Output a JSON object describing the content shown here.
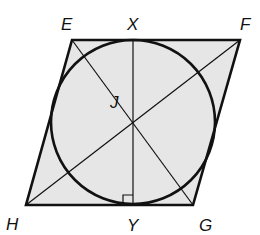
{
  "diagram": {
    "type": "rhombus-with-inscribed-circle",
    "colors": {
      "fill": "#e6e6e6",
      "stroke": "#111111",
      "background": "#ffffff"
    },
    "points": {
      "E": {
        "label": "E",
        "x": 72,
        "y": 40,
        "lx": 61,
        "ly": 30
      },
      "X": {
        "label": "X",
        "x": 133,
        "y": 40,
        "lx": 127,
        "ly": 30
      },
      "F": {
        "label": "F",
        "x": 240,
        "y": 40,
        "lx": 240,
        "ly": 30
      },
      "J": {
        "label": "J",
        "x": 133,
        "y": 122,
        "lx": 110,
        "ly": 108
      },
      "H": {
        "label": "H",
        "x": 26,
        "y": 205,
        "lx": 6,
        "ly": 230
      },
      "Y": {
        "label": "Y",
        "x": 133,
        "y": 205,
        "lx": 127,
        "ly": 231
      },
      "G": {
        "label": "G",
        "x": 193,
        "y": 205,
        "lx": 199,
        "ly": 231
      }
    },
    "circle": {
      "center": "J",
      "radius": 82
    },
    "segments": [
      [
        "E",
        "G"
      ],
      [
        "F",
        "H"
      ],
      [
        "X",
        "Y"
      ]
    ],
    "right_angle_marker": {
      "at": "Y",
      "size": 10
    }
  }
}
